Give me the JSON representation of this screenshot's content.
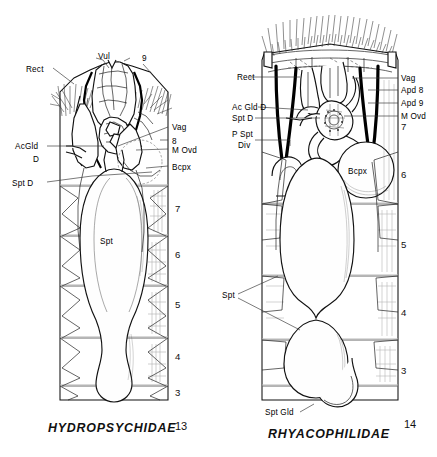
{
  "plate": {
    "background": "#ffffff",
    "ink": "#111111",
    "figures": [
      {
        "id": "fig13",
        "number": "13",
        "caption": "HYDROPSYCHIDAE",
        "labels_left": [
          {
            "key": "rect",
            "text": "Rect"
          },
          {
            "key": "acgld_d_1",
            "text": "AcGld"
          },
          {
            "key": "acgld_d_2",
            "text": "D"
          },
          {
            "key": "spt_d",
            "text": "Spt D"
          }
        ],
        "labels_top": [
          {
            "key": "vul",
            "text": "Vul"
          },
          {
            "key": "nine",
            "text": "9"
          }
        ],
        "labels_right": [
          {
            "key": "vag",
            "text": "Vag"
          },
          {
            "key": "eight",
            "text": "8"
          },
          {
            "key": "m_ovd",
            "text": "M Ovd"
          },
          {
            "key": "bcpx",
            "text": "Bcpx"
          }
        ],
        "labels_inner": [
          {
            "key": "spt",
            "text": "Spt"
          }
        ],
        "segments": [
          "7",
          "6",
          "5",
          "4",
          "3"
        ]
      },
      {
        "id": "fig14",
        "number": "14",
        "caption": "RHYACOPHILIDAE",
        "labels_left": [
          {
            "key": "rect",
            "text": "Rect"
          },
          {
            "key": "ac_gld_d",
            "text": "Ac Gld D"
          },
          {
            "key": "spt_d",
            "text": "Spt D"
          },
          {
            "key": "p_spt_div_1",
            "text": "P Spt"
          },
          {
            "key": "p_spt_div_2",
            "text": "Div"
          },
          {
            "key": "spt",
            "text": "Spt"
          }
        ],
        "labels_right": [
          {
            "key": "vag",
            "text": "Vag"
          },
          {
            "key": "apd8",
            "text": "Apd 8"
          },
          {
            "key": "apd9",
            "text": "Apd 9"
          },
          {
            "key": "m_ovd",
            "text": "M Ovd"
          }
        ],
        "labels_inner": [
          {
            "key": "bcpx",
            "text": "Bcpx"
          },
          {
            "key": "spt_gld",
            "text": "Spt Gld"
          }
        ],
        "segments": [
          "7",
          "6",
          "5",
          "4",
          "3"
        ]
      }
    ]
  }
}
